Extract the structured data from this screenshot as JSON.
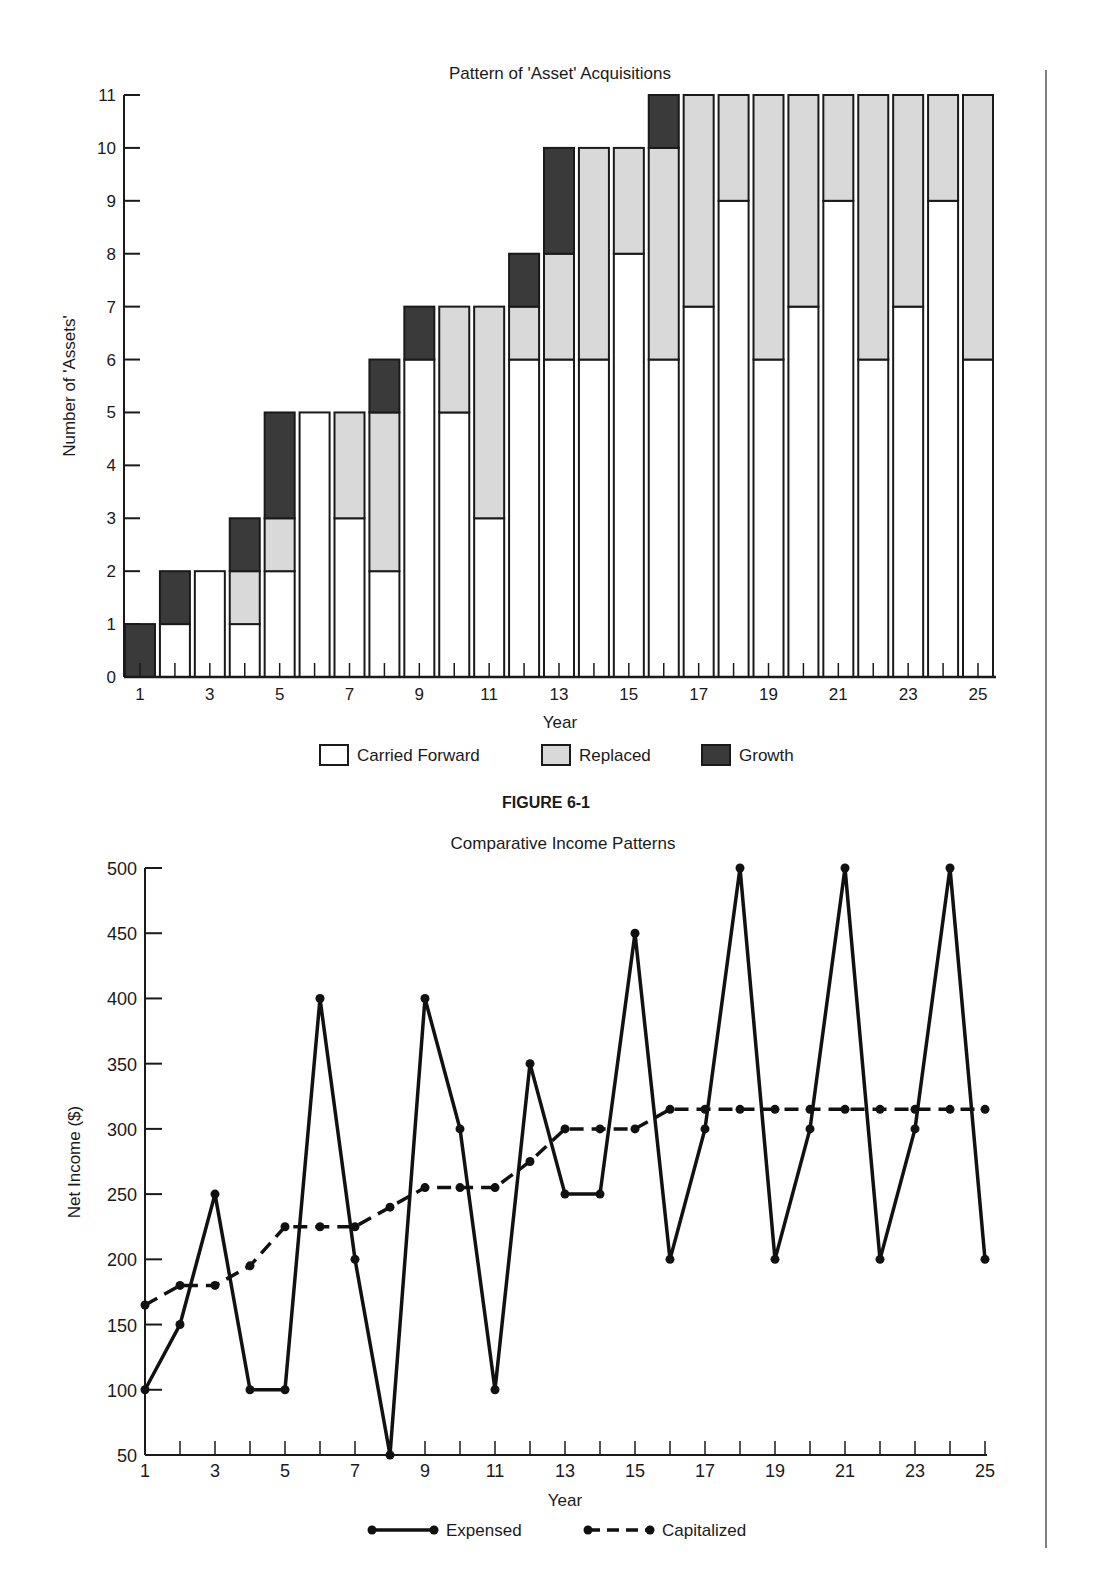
{
  "figure_caption": "FIGURE 6-1",
  "chart_data": [
    {
      "type": "bar",
      "stacked": true,
      "title": "Pattern of 'Asset' Acquisitions",
      "xlabel": "Year",
      "ylabel": "Number of 'Assets'",
      "ylim": [
        0,
        11
      ],
      "yticks": [
        0,
        1,
        2,
        3,
        4,
        5,
        6,
        7,
        8,
        9,
        10,
        11
      ],
      "xtick_labels": [
        "1",
        "3",
        "5",
        "7",
        "9",
        "11",
        "13",
        "15",
        "17",
        "19",
        "21",
        "23",
        "25"
      ],
      "categories": [
        1,
        2,
        3,
        4,
        5,
        6,
        7,
        8,
        9,
        10,
        11,
        12,
        13,
        14,
        15,
        16,
        17,
        18,
        19,
        20,
        21,
        22,
        23,
        24,
        25
      ],
      "grid": false,
      "legend_position": "bottom",
      "series": [
        {
          "name": "Carried Forward",
          "color": "#ffffff",
          "values": [
            0,
            1,
            2,
            1,
            2,
            5,
            3,
            2,
            6,
            5,
            3,
            6,
            6,
            6,
            8,
            6,
            7,
            9,
            6,
            7,
            9,
            6,
            7,
            9,
            6
          ]
        },
        {
          "name": "Replaced",
          "color": "#d9d9d9",
          "values": [
            0,
            0,
            0,
            1,
            1,
            0,
            2,
            3,
            0,
            2,
            4,
            1,
            2,
            4,
            2,
            4,
            4,
            2,
            5,
            4,
            2,
            5,
            4,
            2,
            5
          ]
        },
        {
          "name": "Growth",
          "color": "#3a3a3a",
          "values": [
            1,
            1,
            0,
            1,
            2,
            0,
            0,
            1,
            1,
            0,
            0,
            1,
            2,
            0,
            0,
            1,
            0,
            0,
            0,
            0,
            0,
            0,
            0,
            0,
            0
          ]
        }
      ]
    },
    {
      "type": "line",
      "title": "Comparative Income Patterns",
      "xlabel": "Year",
      "ylabel": "Net Income ($)",
      "ylim": [
        50,
        500
      ],
      "yticks": [
        50,
        100,
        150,
        200,
        250,
        300,
        350,
        400,
        450,
        500
      ],
      "xtick_labels": [
        "1",
        "3",
        "5",
        "7",
        "9",
        "11",
        "13",
        "15",
        "17",
        "19",
        "21",
        "23",
        "25"
      ],
      "x": [
        1,
        2,
        3,
        4,
        5,
        6,
        7,
        8,
        9,
        10,
        11,
        12,
        13,
        14,
        15,
        16,
        17,
        18,
        19,
        20,
        21,
        22,
        23,
        24,
        25
      ],
      "grid": false,
      "legend_position": "bottom",
      "series": [
        {
          "name": "Expensed",
          "style": "solid",
          "values": [
            100,
            150,
            250,
            100,
            100,
            400,
            200,
            50,
            400,
            300,
            100,
            350,
            250,
            250,
            450,
            200,
            300,
            500,
            200,
            300,
            500,
            200,
            300,
            500,
            200
          ]
        },
        {
          "name": "Capitalized",
          "style": "dashed",
          "values": [
            165,
            180,
            180,
            195,
            225,
            225,
            225,
            240,
            255,
            255,
            255,
            275,
            300,
            300,
            300,
            315,
            315,
            315,
            315,
            315,
            315,
            315,
            315,
            315,
            315
          ]
        }
      ]
    }
  ]
}
